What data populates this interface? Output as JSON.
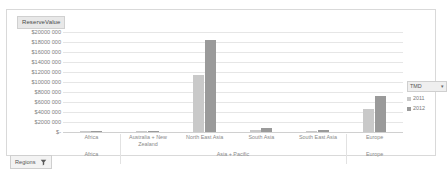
{
  "axis_title": "ReserveValue",
  "legend": {
    "header": "TMD",
    "chevron": "▾",
    "items": [
      {
        "label": "2011",
        "color": "#c9c9c9"
      },
      {
        "label": "2012",
        "color": "#9a9a9a"
      }
    ]
  },
  "slicer": {
    "label": "Regions",
    "icon": "filter-funnel-icon"
  },
  "chart_data": {
    "type": "bar",
    "title": "ReserveValue",
    "xlabel": "",
    "ylabel": "ReserveValue",
    "ylim": [
      0,
      20000000
    ],
    "grid": true,
    "legend_position": "right",
    "ytick_labels": [
      "$20000 000",
      "$18000 000",
      "$16000 000",
      "$14000 000",
      "$12000 000",
      "$10000 000",
      "$8000 000",
      "$6000 000",
      "$4000 000",
      "$2000 000",
      "$-"
    ],
    "ytick_values": [
      20000000,
      18000000,
      16000000,
      14000000,
      12000000,
      10000000,
      8000000,
      6000000,
      4000000,
      2000000,
      0
    ],
    "groups": [
      {
        "label": "Africa",
        "categories": [
          "Africa"
        ]
      },
      {
        "label": "Asia + Pacific",
        "categories": [
          "Australia + New Zealand",
          "North East Asia",
          "South Asia",
          "South East Asia"
        ]
      },
      {
        "label": "Europe",
        "categories": [
          "Europe"
        ]
      }
    ],
    "categories": [
      "Africa",
      "Australia + New Zealand",
      "North East Asia",
      "South Asia",
      "South East Asia",
      "Europe"
    ],
    "series": [
      {
        "name": "2011",
        "color": "#c9c9c9",
        "values": [
          60000,
          180000,
          11400000,
          350000,
          200000,
          4600000
        ]
      },
      {
        "name": "2012",
        "color": "#9a9a9a",
        "values": [
          70000,
          210000,
          18400000,
          900000,
          420000,
          7300000
        ]
      }
    ]
  }
}
